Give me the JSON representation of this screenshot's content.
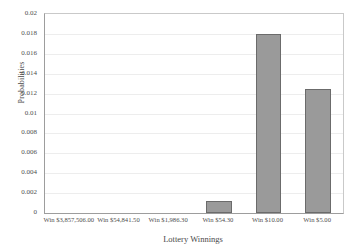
{
  "chart_data": {
    "type": "bar",
    "title": "",
    "xlabel": "Lottery Winnings",
    "ylabel": "Probabilities",
    "categories": [
      "Win $3,857,506.00",
      "Win $54,841.50",
      "Win $1,986.30",
      "Win $54.30",
      "Win $10.00",
      "Win $5.00"
    ],
    "values": [
      0,
      0,
      0,
      0.0012,
      0.018,
      0.0125
    ],
    "ylim": [
      0,
      0.02
    ],
    "yticks": [
      0,
      0.002,
      0.004,
      0.006,
      0.008,
      0.01,
      0.012,
      0.014,
      0.016,
      0.018,
      0.02
    ],
    "ytick_labels": [
      "0",
      "0.002",
      "0.004",
      "0.006",
      "0.008",
      "0.01",
      "0.012",
      "0.014",
      "0.016",
      "0.018",
      "0.02"
    ],
    "grid": true,
    "legend": false,
    "bar_color": "#9a9a9a",
    "bar_border_color": "#6b6b6b",
    "grid_color": "#ededed",
    "axis_color": "#9d9d9d"
  }
}
